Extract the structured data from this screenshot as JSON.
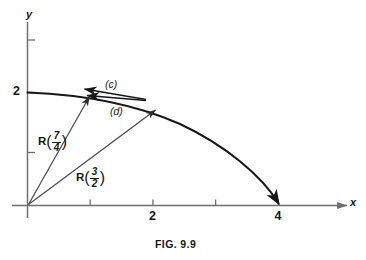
{
  "figure": {
    "caption": "FIG. 9.9",
    "axes": {
      "x_label": "x",
      "y_label": "y",
      "x_ticks": [
        {
          "value": 1,
          "label": ""
        },
        {
          "value": 2,
          "label": "2"
        },
        {
          "value": 3,
          "label": ""
        },
        {
          "value": 4,
          "label": "4"
        }
      ],
      "y_ticks": [
        {
          "value": 1,
          "label": ""
        },
        {
          "value": 2,
          "label": "2"
        },
        {
          "value": 3,
          "label": ""
        }
      ],
      "x_range": [
        0,
        5.2
      ],
      "y_range": [
        0,
        3.4
      ]
    },
    "curve": {
      "description": "elliptical-arc",
      "x_intercept": 4,
      "y_intercept": 2,
      "color": "#17171a"
    },
    "vectors": [
      {
        "name": "R",
        "arg_numerator": "7",
        "arg_denominator": "4",
        "label_name": "R",
        "open_paren": "(",
        "close_paren": ")",
        "tip_x": 1.0,
        "tip_y": 1.9365,
        "color": "#4a4a52"
      },
      {
        "name": "R",
        "arg_numerator": "3",
        "arg_denominator": "2",
        "label_name": "R",
        "open_paren": "(",
        "close_paren": ")",
        "tip_x": 2.02,
        "tip_y": 1.7234,
        "color": "#4a4a52"
      }
    ],
    "annotations": [
      {
        "id": "c",
        "label": "(c)"
      },
      {
        "id": "d",
        "label": "(d)"
      }
    ],
    "colors": {
      "curve": "#17171a",
      "axis": "#6d6d75",
      "vector": "#4a4a52",
      "annotation_arrow": "#17171a",
      "text": "#17171a",
      "background": "#ffffff"
    }
  }
}
